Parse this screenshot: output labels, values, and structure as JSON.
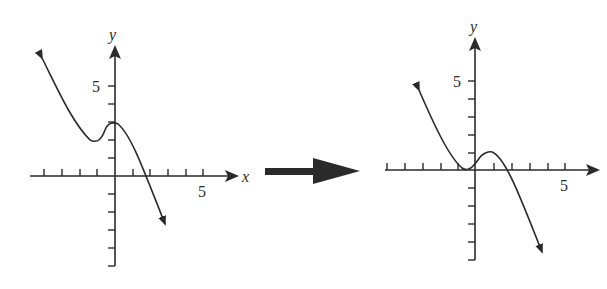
{
  "figure": {
    "transition_arrow": "right-arrow",
    "colors": {
      "ink": "#2a2a2a",
      "background": "#ffffff"
    }
  },
  "left_graph": {
    "x_axis_label": "x",
    "y_axis_label": "y",
    "x_tick_label": "5",
    "y_tick_label": "5"
  },
  "right_graph": {
    "y_axis_label": "y",
    "x_tick_label": "5",
    "y_tick_label": "5"
  }
}
